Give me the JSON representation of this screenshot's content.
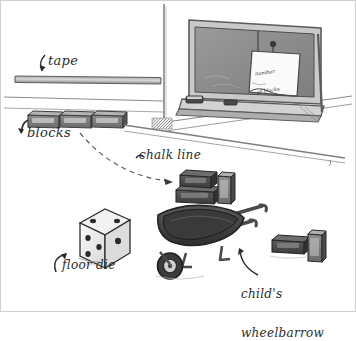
{
  "figure": {
    "medium": "pencil sketch",
    "background_color": "#fdfdfc",
    "ink_color": "#2b2b2b"
  },
  "labels": {
    "tape": "tape",
    "blocks": "blocks",
    "chalk_line": "chalk line",
    "floor_die": "floor die",
    "wheelbarrow_line1": "child's",
    "wheelbarrow_line2": "wheelbarrow"
  },
  "note": {
    "line1": "number",
    "line2": "of blocks"
  },
  "objects": {
    "chalkboard": "chalkboard",
    "chalk_tray": "chalk-tray",
    "eraser": "eraser",
    "chalk_stick": "chalk-stick",
    "pinned_note": "pinned-note",
    "pushpin": "pushpin",
    "wall_corner": "wall-corner",
    "tape_strip": "tape-strip",
    "block_row_count": 3,
    "block_cluster_count": 3,
    "block_pair_count": 2,
    "wheelbarrow": "childs-wheelbarrow",
    "die": "floor-die"
  },
  "die": {
    "top_pips": 2,
    "front_pips": 4,
    "side_pips": 2
  }
}
